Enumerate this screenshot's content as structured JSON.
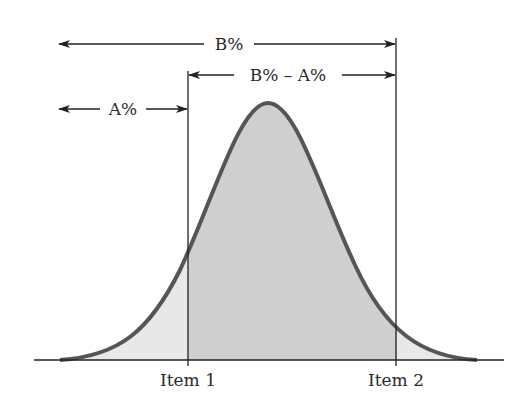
{
  "diagram": {
    "type": "normal-distribution-area",
    "labels": {
      "b_range": "B%",
      "difference": "B% – A%",
      "a_range": "A%",
      "item1": "Item 1",
      "item2": "Item 2"
    },
    "colors": {
      "curve": "#555555",
      "central_fill": "#cfcfcf",
      "tail_fill": "#e6e6e6",
      "lines": "#222222"
    }
  }
}
